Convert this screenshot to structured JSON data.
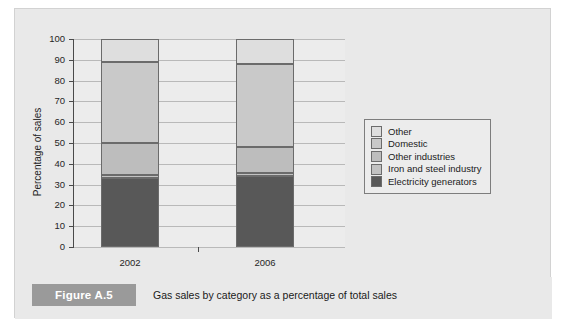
{
  "figure": {
    "tag": "Figure A.5",
    "caption": "Gas sales by category as a percentage of total sales"
  },
  "colors": {
    "panel_background": "#e9e9e9",
    "plot_background": "#ececec",
    "axis": "#4a4a4a",
    "gridline": "#b9b9b9",
    "segment_border": "#6b6b6b",
    "caption_tag_background": "#9a9a9a"
  },
  "chart_data": {
    "type": "bar",
    "stacked": true,
    "stack_mode": "percent",
    "title": "",
    "subtitle": "",
    "xlabel": "",
    "ylabel": "Percentage of sales",
    "categories": [
      "2002",
      "2006"
    ],
    "ylim": [
      0,
      100
    ],
    "yticks": [
      0,
      10,
      20,
      30,
      40,
      50,
      60,
      70,
      80,
      90,
      100
    ],
    "ytick_labels": [
      "0",
      "10",
      "20",
      "30",
      "40",
      "50",
      "60",
      "70",
      "80",
      "90",
      "100"
    ],
    "grid": true,
    "grid_axis": "y",
    "legend_position": "right",
    "series": [
      {
        "name": "Electricity generators",
        "color": "#585858",
        "values": [
          33,
          34
        ],
        "order": 0
      },
      {
        "name": "Iron and steel industry",
        "color": "#c2c2c2",
        "values": [
          1.5,
          1.5
        ],
        "order": 1
      },
      {
        "name": "Other industries",
        "color": "#bdbdbd",
        "values": [
          15.5,
          12.5
        ],
        "order": 2
      },
      {
        "name": "Domestic",
        "color": "#c9c9c9",
        "values": [
          39,
          40
        ],
        "order": 3
      },
      {
        "name": "Other",
        "color": "#dedede",
        "values": [
          11,
          12
        ],
        "order": 4
      }
    ],
    "legend_entries": [
      {
        "label": "Other",
        "color": "#dedede"
      },
      {
        "label": "Domestic",
        "color": "#c9c9c9"
      },
      {
        "label": "Other industries",
        "color": "#bdbdbd"
      },
      {
        "label": "Iron and steel industry",
        "color": "#c2c2c2"
      },
      {
        "label": "Electricity generators",
        "color": "#585858"
      }
    ]
  }
}
